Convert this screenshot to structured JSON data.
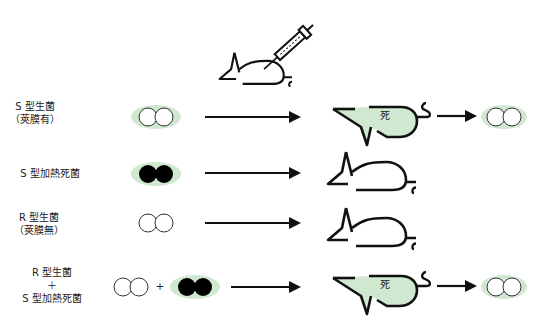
{
  "colors": {
    "capsule_green": "#cfe8cf",
    "mouse_fill_green": "#cfe8cf",
    "stroke": "#111111"
  },
  "top": {
    "icon": "mouse-with-syringe"
  },
  "rows": [
    {
      "label_line1": "S 型生菌",
      "label_line2": "（莢膜有）",
      "bacteria": "s-live",
      "mouse_state": "dead",
      "mouse_text": "死",
      "result": "s-live"
    },
    {
      "label_line1": "S 型加熱死菌",
      "label_line2": "",
      "bacteria": "s-heat-killed",
      "mouse_state": "alive",
      "mouse_text": "",
      "result": ""
    },
    {
      "label_line1": "R 型生菌",
      "label_line2": "（莢膜無）",
      "bacteria": "r-live",
      "mouse_state": "alive",
      "mouse_text": "",
      "result": ""
    },
    {
      "label_line1": "R 型生菌",
      "label_plus": "＋",
      "label_line2": "S 型加熱死菌",
      "bacteria": "r-live + s-heat-killed",
      "plus": "+",
      "mouse_state": "dead",
      "mouse_text": "死",
      "result": "s-live"
    }
  ]
}
